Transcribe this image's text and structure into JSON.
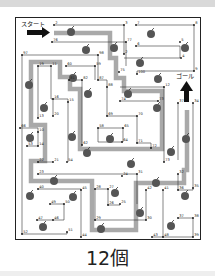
{
  "puzzle": {
    "start_label": "スタート",
    "goal_label": "ゴール",
    "answer": "12個",
    "apple_count": 12,
    "colors": {
      "path": "#a9a9a9",
      "line": "#333333",
      "apple": "#555555",
      "frame": "#222222"
    }
  },
  "points": [
    {
      "n": "2",
      "x": 54,
      "y": 25
    },
    {
      "n": "3",
      "x": 124,
      "y": 25
    },
    {
      "n": "7",
      "x": 136,
      "y": 25
    },
    {
      "n": "8",
      "x": 194,
      "y": 25
    },
    {
      "n": "76",
      "x": 52,
      "y": 42
    },
    {
      "n": "77",
      "x": 126,
      "y": 42
    },
    {
      "n": "5",
      "x": 180,
      "y": 42
    },
    {
      "n": "6",
      "x": 136,
      "y": 46
    },
    {
      "n": "97",
      "x": 22,
      "y": 55
    },
    {
      "n": "98",
      "x": 98,
      "y": 55
    },
    {
      "n": "4",
      "x": 181,
      "y": 58
    },
    {
      "n": "2b",
      "x": 124,
      "y": 54
    },
    {
      "n": "19",
      "x": 38,
      "y": 66
    },
    {
      "n": "11",
      "x": 51,
      "y": 66
    },
    {
      "n": "60",
      "x": 66,
      "y": 66
    },
    {
      "n": "59",
      "x": 95,
      "y": 66
    },
    {
      "n": "9",
      "x": 194,
      "y": 71
    },
    {
      "n": "75",
      "x": 119,
      "y": 72
    },
    {
      "n": "100",
      "x": 137,
      "y": 74
    },
    {
      "n": "87",
      "x": 98,
      "y": 80
    },
    {
      "n": "81",
      "x": 69,
      "y": 80
    },
    {
      "n": "82",
      "x": 82,
      "y": 80
    },
    {
      "n": "12",
      "x": 164,
      "y": 87
    },
    {
      "n": "88",
      "x": 107,
      "y": 87
    },
    {
      "n": "74",
      "x": 120,
      "y": 101
    },
    {
      "n": "73",
      "x": 158,
      "y": 101
    },
    {
      "n": "16",
      "x": 53,
      "y": 99
    },
    {
      "n": "15",
      "x": 68,
      "y": 102
    },
    {
      "n": "37",
      "x": 178,
      "y": 103
    },
    {
      "n": "34",
      "x": 193,
      "y": 103
    },
    {
      "n": "20",
      "x": 53,
      "y": 116
    },
    {
      "n": "13",
      "x": 38,
      "y": 118
    },
    {
      "n": "69",
      "x": 107,
      "y": 116
    },
    {
      "n": "70",
      "x": 137,
      "y": 116
    },
    {
      "n": "58",
      "x": 98,
      "y": 128
    },
    {
      "n": "65",
      "x": 123,
      "y": 128
    },
    {
      "n": "66",
      "x": 20,
      "y": 128
    },
    {
      "n": "10",
      "x": 38,
      "y": 132
    },
    {
      "n": "53",
      "x": 27,
      "y": 146
    },
    {
      "n": "14",
      "x": 38,
      "y": 146
    },
    {
      "n": "62",
      "x": 82,
      "y": 145
    },
    {
      "n": "64",
      "x": 122,
      "y": 142
    },
    {
      "n": "71",
      "x": 137,
      "y": 143
    },
    {
      "n": "72",
      "x": 151,
      "y": 148
    },
    {
      "n": "22",
      "x": 38,
      "y": 162
    },
    {
      "n": "21",
      "x": 53,
      "y": 162
    },
    {
      "n": "54",
      "x": 67,
      "y": 162
    },
    {
      "n": "73b",
      "x": 164,
      "y": 162
    },
    {
      "n": "23",
      "x": 38,
      "y": 174
    },
    {
      "n": "24",
      "x": 122,
      "y": 176
    },
    {
      "n": "31",
      "x": 137,
      "y": 174
    },
    {
      "n": "32",
      "x": 178,
      "y": 174
    },
    {
      "n": "40",
      "x": 38,
      "y": 189
    },
    {
      "n": "45",
      "x": 81,
      "y": 190
    },
    {
      "n": "28",
      "x": 95,
      "y": 189
    },
    {
      "n": "27",
      "x": 108,
      "y": 189
    },
    {
      "n": "42",
      "x": 146,
      "y": 190
    },
    {
      "n": "41",
      "x": 163,
      "y": 190
    },
    {
      "n": "36",
      "x": 178,
      "y": 190
    },
    {
      "n": "35",
      "x": 193,
      "y": 188
    },
    {
      "n": "49",
      "x": 50,
      "y": 204
    },
    {
      "n": "50",
      "x": 64,
      "y": 204
    },
    {
      "n": "26",
      "x": 108,
      "y": 205
    },
    {
      "n": "25",
      "x": 120,
      "y": 204
    },
    {
      "n": "47",
      "x": 37,
      "y": 220
    },
    {
      "n": "46",
      "x": 53,
      "y": 220
    },
    {
      "n": "29",
      "x": 95,
      "y": 220
    },
    {
      "n": "30",
      "x": 146,
      "y": 220
    },
    {
      "n": "37b",
      "x": 178,
      "y": 218
    },
    {
      "n": "38",
      "x": 193,
      "y": 218
    },
    {
      "n": "52",
      "x": 22,
      "y": 234
    },
    {
      "n": "51",
      "x": 67,
      "y": 232
    },
    {
      "n": "44",
      "x": 81,
      "y": 237
    },
    {
      "n": "43",
      "x": 152,
      "y": 237
    },
    {
      "n": "48",
      "x": 163,
      "y": 237
    },
    {
      "n": "39",
      "x": 193,
      "y": 237
    }
  ],
  "apples": [
    {
      "x": 71,
      "y": 32
    },
    {
      "x": 151,
      "y": 34
    },
    {
      "x": 185,
      "y": 48
    },
    {
      "x": 86,
      "y": 50
    },
    {
      "x": 112,
      "y": 48
    },
    {
      "x": 140,
      "y": 62
    },
    {
      "x": 29,
      "y": 85
    },
    {
      "x": 73,
      "y": 78
    },
    {
      "x": 157,
      "y": 77
    },
    {
      "x": 133,
      "y": 84
    },
    {
      "x": 45,
      "y": 108
    },
    {
      "x": 88,
      "y": 92
    },
    {
      "x": 123,
      "y": 92
    },
    {
      "x": 158,
      "y": 108
    },
    {
      "x": 31,
      "y": 138
    },
    {
      "x": 73,
      "y": 137
    },
    {
      "x": 110,
      "y": 139
    },
    {
      "x": 187,
      "y": 138
    },
    {
      "x": 87,
      "y": 153
    },
    {
      "x": 171,
      "y": 152
    },
    {
      "x": 131,
      "y": 165
    },
    {
      "x": 54,
      "y": 181
    },
    {
      "x": 31,
      "y": 195
    },
    {
      "x": 73,
      "y": 196
    },
    {
      "x": 115,
      "y": 192
    },
    {
      "x": 157,
      "y": 182
    },
    {
      "x": 185,
      "y": 196
    },
    {
      "x": 140,
      "y": 213
    },
    {
      "x": 43,
      "y": 227
    },
    {
      "x": 101,
      "y": 227
    },
    {
      "x": 171,
      "y": 226
    }
  ]
}
